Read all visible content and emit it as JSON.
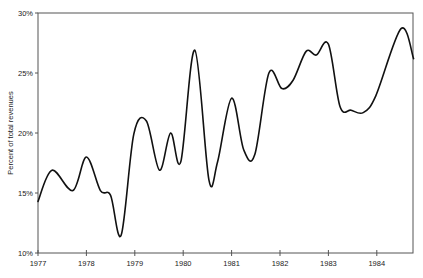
{
  "chart_data": {
    "type": "line",
    "title": "",
    "xlabel": "",
    "ylabel": "Percent of total revenues",
    "xlim": [
      1977,
      1984.76
    ],
    "ylim": [
      10,
      30
    ],
    "grid": false,
    "legend": null,
    "x_ticks": [
      "1977",
      "1978",
      "1979",
      "1980",
      "1981",
      "1982",
      "1983",
      "1984"
    ],
    "y_ticks": [
      "10%",
      "15%",
      "20%",
      "25%",
      "30%"
    ],
    "series": [
      {
        "name": "Percent of total revenues",
        "color": "#111111",
        "x": [
          1977.0,
          1977.29,
          1977.72,
          1978.0,
          1978.29,
          1978.5,
          1978.72,
          1978.98,
          1979.24,
          1979.51,
          1979.74,
          1979.95,
          1980.24,
          1980.53,
          1980.71,
          1981.0,
          1981.25,
          1981.48,
          1981.77,
          1982.04,
          1982.27,
          1982.54,
          1982.75,
          1983.0,
          1983.24,
          1983.47,
          1983.72,
          1983.98,
          1984.5,
          1984.76
        ],
        "values": [
          14.3,
          16.9,
          15.2,
          18.0,
          15.2,
          14.8,
          11.5,
          19.9,
          21.0,
          16.9,
          20.0,
          17.6,
          26.9,
          16.1,
          17.6,
          22.9,
          18.6,
          18.2,
          25.0,
          23.7,
          24.4,
          26.8,
          26.5,
          27.4,
          22.2,
          21.9,
          21.7,
          23.1,
          28.7,
          26.2
        ]
      }
    ]
  },
  "axes": {
    "y_label": "Percent of total revenues",
    "x_tick_labels": [
      "1977",
      "1978",
      "1979",
      "1980",
      "1981",
      "1982",
      "1983",
      "1984"
    ],
    "y_tick_labels": [
      "10%",
      "15%",
      "20%",
      "25%",
      "30%"
    ]
  }
}
